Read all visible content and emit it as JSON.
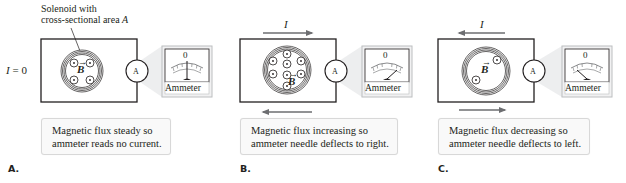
{
  "annotation": {
    "line1": "Solenoid with",
    "line2": "cross-sectional area ",
    "line2_var": "A"
  },
  "current_label_a": "I = 0",
  "field_symbol": "B",
  "current_symbol": "I",
  "ammeter": {
    "zero_label": "0",
    "name_label": "Ammeter",
    "circle_label": "A"
  },
  "panels": [
    {
      "label": "A.",
      "current": "I = 0",
      "flux_state": "steady",
      "needle": "center",
      "caption_line1": "Magnetic flux steady so",
      "caption_line2": "ammeter reads no current."
    },
    {
      "label": "B.",
      "current": "I",
      "current_direction_top": "right",
      "flux_state": "increasing",
      "needle": "right",
      "caption_line1": "Magnetic flux increasing so",
      "caption_line2": "ammeter needle deflects to right."
    },
    {
      "label": "C.",
      "current": "I",
      "current_direction_top": "left",
      "flux_state": "decreasing",
      "needle": "left",
      "caption_line1": "Magnetic flux decreasing so",
      "caption_line2": "ammeter needle deflects to left."
    }
  ],
  "colors": {
    "line": "#231f20",
    "arrow": "#6d6e71",
    "callout": "#e6e7e8",
    "caption_bg": "#f9f9f9",
    "caption_border": "#d8d8d8"
  }
}
